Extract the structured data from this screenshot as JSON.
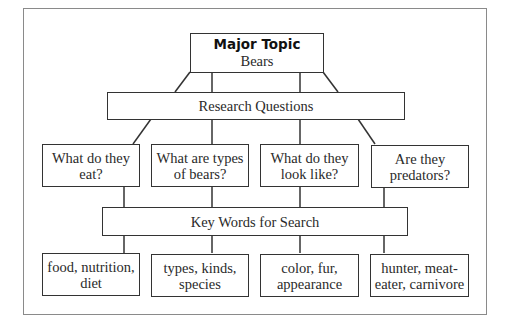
{
  "major_topic": {
    "title": "Major Topic",
    "subject": "Bears"
  },
  "research_questions": {
    "label": "Research Questions",
    "items": [
      {
        "line1": "What do they",
        "line2": "eat?"
      },
      {
        "line1": "What are types",
        "line2": "of bears?"
      },
      {
        "line1": "What do they",
        "line2": "look like?"
      },
      {
        "line1": "Are they",
        "line2": "predators?"
      }
    ]
  },
  "key_words": {
    "label": "Key Words for Search",
    "items": [
      {
        "line1": "food, nutrition,",
        "line2": "diet"
      },
      {
        "line1": "types, kinds,",
        "line2": "species"
      },
      {
        "line1": "color, fur,",
        "line2": "appearance"
      },
      {
        "line1": "hunter, meat-",
        "line2": "eater, carnivore"
      }
    ]
  }
}
